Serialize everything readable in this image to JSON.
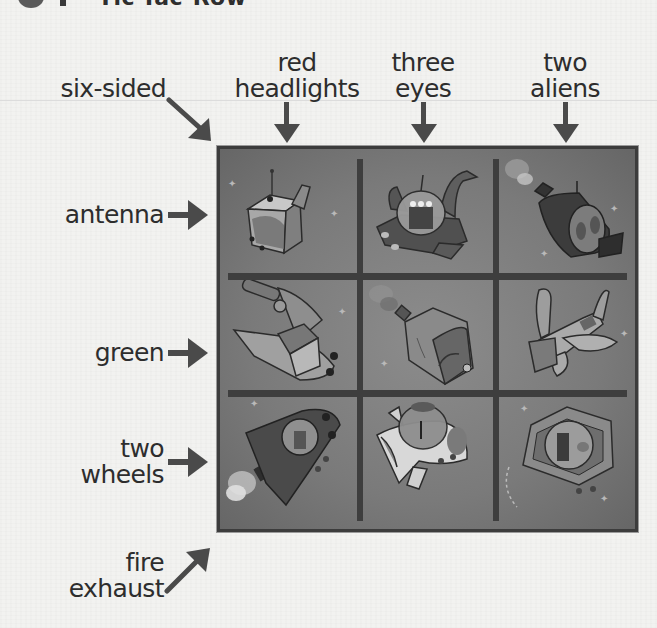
{
  "header": {
    "number": "9",
    "title": "Tic-Tac-Row"
  },
  "puzzle": {
    "column_clues": [
      {
        "label_line1": "",
        "label_line2": "six-sided",
        "direction": "diagonal-down-right"
      },
      {
        "label_line1": "red",
        "label_line2": "headlights",
        "direction": "down"
      },
      {
        "label_line1": "three",
        "label_line2": "eyes",
        "direction": "down"
      },
      {
        "label_line1": "two",
        "label_line2": "aliens",
        "direction": "down"
      }
    ],
    "row_clues": [
      {
        "label_line1": "",
        "label_line2": "antenna",
        "direction": "right"
      },
      {
        "label_line1": "",
        "label_line2": "green",
        "direction": "right"
      },
      {
        "label_line1": "two",
        "label_line2": "wheels",
        "direction": "right"
      },
      {
        "label_line1": "fire",
        "label_line2": "exhaust",
        "direction": "diagonal-up-right"
      }
    ],
    "grid": {
      "rows": 3,
      "cols": 3,
      "cells": [
        {
          "row": 0,
          "col": 0,
          "icon": "cube-spaceship-with-antenna"
        },
        {
          "row": 0,
          "col": 1,
          "icon": "dome-spaceship-three-eyed-alien-with-antenna"
        },
        {
          "row": 0,
          "col": 2,
          "icon": "dark-spaceship-two-aliens-fire-exhaust-antenna"
        },
        {
          "row": 1,
          "col": 0,
          "icon": "rocket-spaceship-two-wheels"
        },
        {
          "row": 1,
          "col": 1,
          "icon": "hexagonal-spaceship-fire-exhaust"
        },
        {
          "row": 1,
          "col": 2,
          "icon": "winged-spaceship"
        },
        {
          "row": 2,
          "col": 0,
          "icon": "dark-spaceship-alien-fire-exhaust-two-wheels"
        },
        {
          "row": 2,
          "col": 1,
          "icon": "white-spaceship-dome-alien-wheels"
        },
        {
          "row": 2,
          "col": 2,
          "icon": "six-sided-spaceship-alien-wheels"
        }
      ]
    }
  },
  "colors": {
    "background": "#f2f2f0",
    "text": "#2d2d2d",
    "arrow": "#4a4a4a",
    "board": "#7d7d7d",
    "grid_lines": "#3e3e3e"
  }
}
